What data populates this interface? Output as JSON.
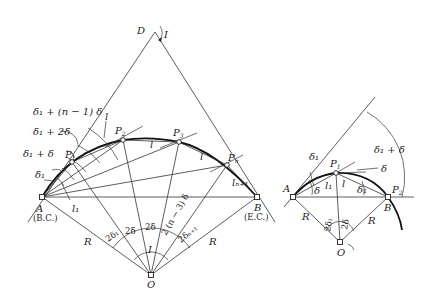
{
  "figure": {
    "left_diagram": {
      "points": {
        "D": "D",
        "A": "A",
        "A_sub": "(B.C.)",
        "B": "B",
        "B_sub": "(E.C.)",
        "O": "O",
        "P1": "P",
        "P1_sub": "1",
        "P2": "P",
        "P2_sub": "2",
        "P3": "P",
        "P3_sub": "3",
        "Pn": "P",
        "Pn_sub": "n"
      },
      "labels": {
        "I_top": "I",
        "I_center": "I",
        "R_left": "R",
        "R_right": "R",
        "delta1": "δ₁",
        "delta1_plus_delta": "δ₁ + δ",
        "delta1_plus_2delta": "δ₁ + 2δ",
        "delta1_plus_n1_delta": "δ₁ + (n − 1) δ",
        "l_chord_top": "l",
        "l_p2p3": "l",
        "l_p3pn": "l",
        "l1": "l₁",
        "ln1": "lₙ₊₁",
        "two_delta1": "2δ₁",
        "two_delta_a": "2δ",
        "two_delta_b": "2δ",
        "two_n3_delta": "2 (n − 3) δ",
        "two_delta_n1": "2δₙ₊₁"
      }
    },
    "right_diagram": {
      "points": {
        "A": "A",
        "B": "B",
        "O": "O",
        "P1": "P",
        "P1_sub": "1",
        "P2": "P",
        "P2_sub": "2"
      },
      "labels": {
        "delta1_top": "δ₁",
        "delta1_plus_delta": "δ₁ + δ",
        "delta": "δ",
        "delta_left": "δ",
        "delta1_right": "δ₁",
        "l1": "l₁",
        "l": "l",
        "R_left": "R",
        "R_right": "R",
        "two_delta1": "2δ₁",
        "two_delta": "2δ"
      }
    }
  }
}
